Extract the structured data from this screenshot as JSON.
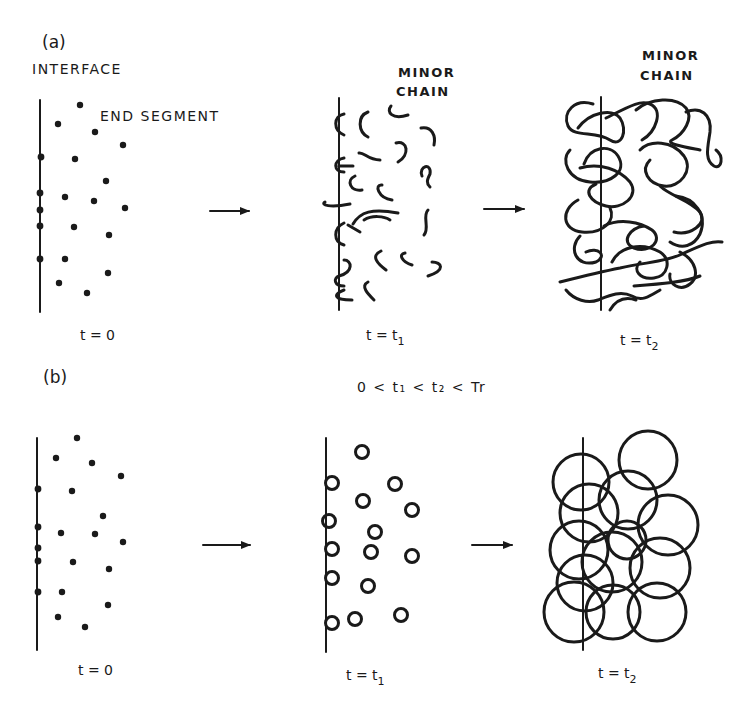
{
  "figure": {
    "panel_a": {
      "label": "(a)",
      "interface_label": "INTERFACE",
      "end_segment_label": "END SEGMENT",
      "minor_chain_label_t1": [
        "MINOR",
        "CHAIN"
      ],
      "minor_chain_label_t2": [
        "MINOR",
        "CHAIN"
      ],
      "time_labels": {
        "t0": "t = 0",
        "t1_main": "t = t",
        "t1_sub": "1",
        "t2_main": "t = t",
        "t2_sub": "2"
      }
    },
    "panel_b": {
      "label": "(b)",
      "condition": "0 < t₁ < t₂ < Tr",
      "time_labels": {
        "t0": "t = 0",
        "t1_main": "t = t",
        "t1_sub": "1",
        "t2_main": "t = t",
        "t2_sub": "2"
      }
    },
    "colors": {
      "ink": "#1a1a1a",
      "background": "#ffffff"
    }
  }
}
